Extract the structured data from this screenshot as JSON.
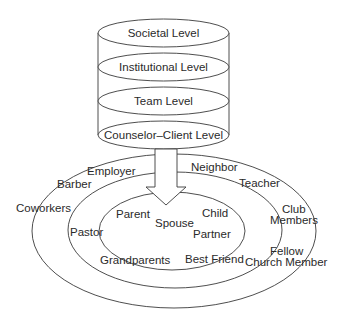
{
  "diagram": {
    "type": "stacked-cylinder-and-concentric-ellipses",
    "cylinder": {
      "levels": [
        {
          "label": "Societal Level"
        },
        {
          "label": "Institutional Level"
        },
        {
          "label": "Team Level"
        },
        {
          "label": "Counselor–Client Level"
        }
      ]
    },
    "arrow": {
      "direction": "down",
      "from": "Counselor–Client Level",
      "to": "inner-circle"
    },
    "circles": {
      "inner": {
        "labels": [
          "Parent",
          "Spouse",
          "Child",
          "Partner",
          "Grandparents",
          "Best Friend"
        ]
      },
      "middle": {
        "labels": [
          "Employer",
          "Neighbor",
          "Barber",
          "Teacher",
          "Pastor",
          "Club",
          "Members",
          "Fellow",
          "Church Member"
        ]
      },
      "outer": {
        "labels": [
          "Coworkers"
        ]
      }
    },
    "colors": {
      "stroke": "#3a3a3a",
      "text": "#2a2a2a",
      "background": "#ffffff"
    }
  }
}
